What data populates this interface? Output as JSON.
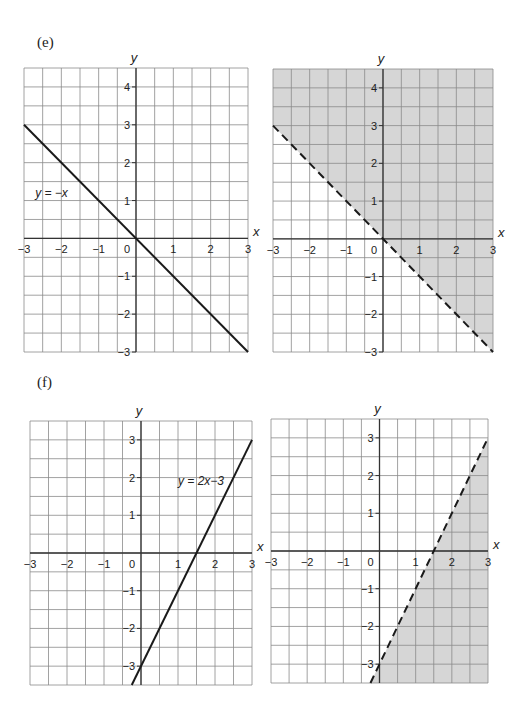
{
  "parts": [
    {
      "label": "(e)"
    },
    {
      "label": "(f)"
    }
  ],
  "colors": {
    "grid": "#8a8a8a",
    "axis": "#333333",
    "line": "#1a1a1a",
    "shade": "#d6d6d6",
    "background": "#ffffff"
  },
  "chart_data": [
    {
      "id": "e-left",
      "part": "(e)",
      "type": "line",
      "title": "",
      "xlabel": "x",
      "ylabel": "y",
      "xlim": [
        -3,
        3
      ],
      "ylim": [
        -3,
        4.5
      ],
      "grid": true,
      "grid_step": 0.5,
      "x_ticks": [
        -3,
        -2,
        -1,
        0,
        1,
        2,
        3
      ],
      "y_ticks": [
        4,
        3,
        2,
        1,
        -1,
        -2,
        -3
      ],
      "series": [
        {
          "name": "y = -x",
          "equation": "y = -x",
          "style": "solid",
          "x": [
            -3,
            3
          ],
          "y": [
            3,
            -3
          ]
        }
      ],
      "annotations": [
        {
          "text": "y = −x",
          "x": -2.7,
          "y": 1.1
        }
      ],
      "shading": null,
      "box": {
        "x0": 24,
        "x1": 248,
        "y0": 68,
        "y1": 352
      }
    },
    {
      "id": "e-right",
      "part": "(e)",
      "type": "area",
      "title": "",
      "xlabel": "x",
      "ylabel": "y",
      "xlim": [
        -3,
        3
      ],
      "ylim": [
        -3,
        4.5
      ],
      "grid": true,
      "grid_step": 0.5,
      "x_ticks": [
        -3,
        -2,
        -1,
        0,
        1,
        2,
        3
      ],
      "y_ticks": [
        4,
        3,
        2,
        1,
        -1,
        -2,
        -3
      ],
      "series": [
        {
          "name": "y = -x",
          "equation": "y = -x",
          "style": "dashed",
          "x": [
            -3,
            3
          ],
          "y": [
            3,
            -3
          ]
        }
      ],
      "annotations": [],
      "shading": {
        "region": "y > -x",
        "side": "above"
      },
      "box": {
        "x0": 273,
        "x1": 493,
        "y0": 69,
        "y1": 352
      }
    },
    {
      "id": "f-left",
      "part": "(f)",
      "type": "line",
      "title": "",
      "xlabel": "x",
      "ylabel": "y",
      "xlim": [
        -3,
        3
      ],
      "ylim": [
        -3.5,
        3.5
      ],
      "grid": true,
      "grid_step": 0.5,
      "x_ticks": [
        -3,
        -2,
        -1,
        0,
        1,
        2,
        3
      ],
      "y_ticks": [
        3,
        2,
        1,
        -1,
        -2,
        -3
      ],
      "series": [
        {
          "name": "y = 2x-3",
          "equation": "y = 2x − 3",
          "style": "solid",
          "x": [
            -0.25,
            3
          ],
          "y": [
            -3.5,
            3
          ]
        }
      ],
      "annotations": [
        {
          "text": "y = 2x−3",
          "x": 1.0,
          "y": 1.8
        }
      ],
      "shading": null,
      "box": {
        "x0": 30,
        "x1": 252,
        "y0": 421,
        "y1": 685
      }
    },
    {
      "id": "f-right",
      "part": "(f)",
      "type": "area",
      "title": "",
      "xlabel": "x",
      "ylabel": "y",
      "xlim": [
        -3,
        3
      ],
      "ylim": [
        -3.5,
        3.5
      ],
      "grid": true,
      "grid_step": 0.5,
      "x_ticks": [
        -3,
        -2,
        -1,
        0,
        1,
        2,
        3
      ],
      "y_ticks": [
        3,
        2,
        1,
        -1,
        -2,
        -3
      ],
      "series": [
        {
          "name": "y = 2x-3",
          "equation": "y = 2x − 3",
          "style": "dashed",
          "x": [
            -0.25,
            3
          ],
          "y": [
            -3.5,
            3
          ]
        }
      ],
      "annotations": [],
      "shading": {
        "region": "y < 2x - 3",
        "side": "below-right"
      },
      "box": {
        "x0": 271,
        "x1": 488,
        "y0": 419,
        "y1": 683
      }
    }
  ]
}
